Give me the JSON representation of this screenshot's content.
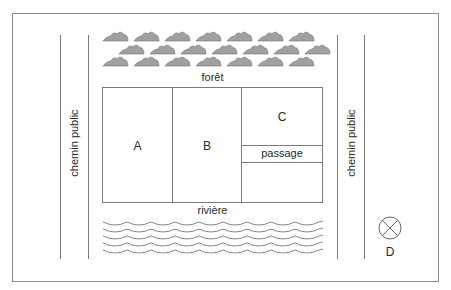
{
  "diagram": {
    "forest_label": "forêt",
    "river_label": "rivière",
    "road_left_label": "chemin public",
    "road_right_label": "chemin public",
    "plots": [
      {
        "id": "A",
        "label": "A"
      },
      {
        "id": "B",
        "label": "B"
      },
      {
        "id": "C",
        "label": "C"
      }
    ],
    "passage_label": "passage",
    "point_label": "D",
    "forest": {
      "rows": 3,
      "trees_per_row": [
        7,
        7,
        7
      ],
      "tree_fill": "#a0a0a0"
    },
    "river": {
      "wave_rows": 5
    },
    "colors": {
      "line": "#7a7a7a",
      "tree": "#a0a0a0",
      "text": "#2a2a2a"
    }
  }
}
